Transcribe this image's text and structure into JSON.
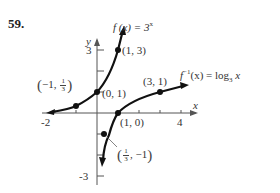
{
  "problem_number": "59.",
  "axes": {
    "x_label": "x",
    "y_label": "y",
    "x_ticks": [
      "-2",
      "4"
    ],
    "y_ticks": [
      "3",
      "-3"
    ]
  },
  "functions": {
    "exp": {
      "label_prefix": "f (x) = 3",
      "label_exp": "x"
    },
    "log": {
      "label_prefix": "f",
      "label_sup": "−1",
      "label_mid": "(x) = log",
      "label_sub": "3",
      "label_suffix": " x"
    }
  },
  "points": {
    "exp": [
      "(1, 3)",
      "(0, 1)"
    ],
    "exp_frac": {
      "pre": "−1,",
      "num": "1",
      "den": "3"
    },
    "log": [
      "(3, 1)",
      "(1, 0)"
    ],
    "log_frac": {
      "num": "1",
      "den": "3",
      "post": ", −1"
    }
  },
  "colors": {
    "curve": "#111111",
    "axis": "#555555",
    "text": "#333333"
  }
}
